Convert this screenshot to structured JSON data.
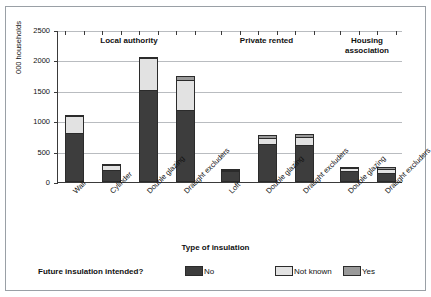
{
  "figure": {
    "border_color": "#9aa0a6",
    "background": "#ffffff"
  },
  "axes": {
    "ylabel": "000 households",
    "xlabel": "Type of insulation",
    "yticks": [
      "0",
      "500",
      "1000",
      "1500",
      "2000",
      "2500"
    ]
  },
  "groups": [
    {
      "id": "local-authority",
      "label": "Local authority"
    },
    {
      "id": "private-rented",
      "label": "Private rented"
    },
    {
      "id": "housing-association",
      "label": "Housing\nassociation"
    }
  ],
  "legend": {
    "title": "Future insulation intended?",
    "items": [
      {
        "key": "no",
        "label": "No",
        "color": "#3d3d3d"
      },
      {
        "key": "not_known",
        "label": "Not known",
        "color": "#e2e2e2"
      },
      {
        "key": "yes",
        "label": "Yes",
        "color": "#9a9a9a"
      }
    ]
  },
  "chart_data": {
    "type": "bar",
    "subtype": "stacked",
    "title": "",
    "xlabel": "Type of insulation",
    "ylabel": "000 households",
    "ylim": [
      0,
      2500
    ],
    "ytick_step": 500,
    "grid": true,
    "legend_position": "bottom",
    "group_field": "Tenure",
    "categories": [
      "Wall",
      "Cylinder",
      "Double glazing",
      "Draught excluders",
      "Loft",
      "Double glazing",
      "Draught excluders",
      "Double glazing",
      "Draught excluders"
    ],
    "category_groups": [
      "Local authority",
      "Local authority",
      "Local authority",
      "Local authority",
      "Private rented",
      "Private rented",
      "Private rented",
      "Housing association",
      "Housing association"
    ],
    "series": [
      {
        "name": "No",
        "color": "#3d3d3d",
        "values": [
          800,
          200,
          1510,
          1185,
          175,
          620,
          615,
          180,
          150
        ]
      },
      {
        "name": "Not known",
        "color": "#e2e2e2",
        "values": [
          285,
          85,
          525,
          500,
          10,
          105,
          130,
          55,
          65
        ]
      },
      {
        "name": "Yes",
        "color": "#9a9a9a",
        "values": [
          25,
          15,
          15,
          65,
          10,
          45,
          50,
          20,
          30
        ]
      }
    ],
    "totals": [
      1110,
      300,
      2050,
      1750,
      195,
      770,
      795,
      255,
      245
    ]
  }
}
